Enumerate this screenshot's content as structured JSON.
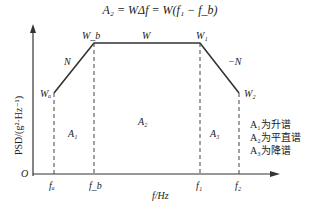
{
  "formula": "A₂ = WΔf = W(f₁ − f_b)",
  "axes": {
    "ylabel": "PSD/(g²·Hz⁻¹)",
    "xlabel": "f/Hz",
    "origin": "O"
  },
  "points": {
    "Wa": "Wₐ",
    "Wb": "W_b",
    "W": "W",
    "W1": "W₁",
    "W2": "W₂"
  },
  "slopes": {
    "up": "N",
    "down": "−N"
  },
  "ticks": {
    "fa": "fₐ",
    "fb": "f_b",
    "f1": "f₁",
    "f2": "f₂"
  },
  "regions": {
    "A1": "A₁",
    "A2": "A₂",
    "A3": "A₃"
  },
  "legend": [
    "A₁为升谱",
    "A₂为平直谱",
    "A₃为降谱"
  ]
}
